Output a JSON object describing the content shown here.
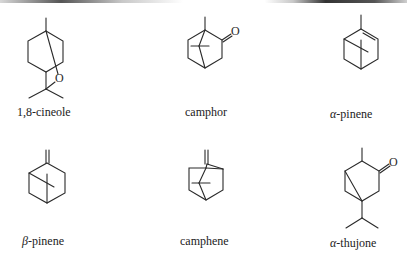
{
  "figure": {
    "compounds": [
      {
        "id": "cineole",
        "name": "1,8-cineole",
        "atom_labels": [
          "O"
        ]
      },
      {
        "id": "camphor",
        "name": "camphor",
        "atom_labels": [
          "O"
        ]
      },
      {
        "id": "alpha-pinene",
        "prefix": "α",
        "name": "-pinene",
        "full_name": "α-pinene",
        "atom_labels": []
      },
      {
        "id": "beta-pinene",
        "prefix": "β",
        "name": "-pinene",
        "full_name": "β-pinene",
        "atom_labels": []
      },
      {
        "id": "camphene",
        "name": "camphene",
        "atom_labels": []
      },
      {
        "id": "alpha-thujone",
        "prefix": "α",
        "name": "-thujone",
        "full_name": "α-thujone",
        "atom_labels": [
          "O"
        ]
      }
    ],
    "colors": {
      "ink": "#2a2a2a",
      "background": "#ffffff"
    }
  }
}
